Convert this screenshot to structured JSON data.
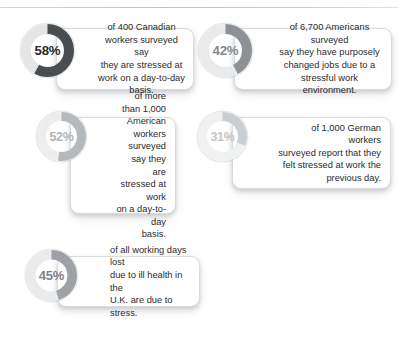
{
  "chart_data": {
    "type": "pie",
    "title": "",
    "subtitle": "",
    "legend": "none",
    "note": "Five separate donut (ring) gauges, each showing one percentage of a 100% ring. Arcs begin at 12 o'clock and sweep clockwise.",
    "categories": [
      "58%",
      "42%",
      "52%",
      "31%",
      "45%"
    ],
    "values": [
      58,
      42,
      52,
      31,
      45
    ],
    "ylim": [
      0,
      100
    ],
    "series": [
      {
        "name": "Canadian workers stressed day-to-day",
        "value": 58,
        "label": "58%",
        "caption": "of 400 Canadian workers surveyed say they are stressed at work on a day-to-day basis.",
        "sample_size": "400",
        "country": "Canada"
      },
      {
        "name": "Americans who changed jobs due to stress",
        "value": 42,
        "label": "42%",
        "caption": "of 6,700 Americans surveyed say they have purposely changed jobs due to a stressful work environment.",
        "sample_size": "6,700",
        "country": "United States"
      },
      {
        "name": "American workers stressed day-to-day",
        "value": 52,
        "label": "52%",
        "caption": "of more than 1,000 American workers surveyed say they are stressed at work on a day-to-day basis.",
        "sample_size": "more than 1,000",
        "country": "United States"
      },
      {
        "name": "German workers stressed previous day",
        "value": 31,
        "label": "31%",
        "caption": "of 1,000 German workers surveyed report that they felt stressed at work the previous day.",
        "sample_size": "1,000",
        "country": "Germany"
      },
      {
        "name": "UK working days lost to stress",
        "value": 45,
        "label": "45%",
        "caption": "of all working days lost due to ill health in the U.K. are due to stress.",
        "sample_size": "",
        "country": "United Kingdom"
      }
    ]
  },
  "stats": [
    {
      "id": "canadian-workers",
      "percent": "58%",
      "value": 58,
      "text": "of 400 Canadian\nworkers surveyed say\nthey are stressed at\nwork on a day-to-day basis.",
      "arc_color": "#4a4d50",
      "track_color": "#e3e5e7",
      "label_color": "#27292b"
    },
    {
      "id": "american-job-changers",
      "percent": "42%",
      "value": 42,
      "text": "of 6,700 Americans surveyed\nsay they have purposely\nchanged jobs due to a\nstressful work environment.",
      "arc_color": "#8d9094",
      "track_color": "#e8eaec",
      "label_color": "#86898d"
    },
    {
      "id": "american-workers",
      "percent": "52%",
      "value": 52,
      "text": "of more than 1,000\nAmerican workers\nsurveyed say they\nare stressed at work\non a day-to-day\nbasis.",
      "arc_color": "#b6b9bc",
      "track_color": "#ebedef",
      "label_color": "#b0b3b6"
    },
    {
      "id": "german-workers",
      "percent": "31%",
      "value": 31,
      "text": "of 1,000 German workers\nsurveyed report that they\nfelt stressed at work the\nprevious day.",
      "arc_color": "#cbced1",
      "track_color": "#eff1f2",
      "label_color": "#c2c5c8"
    },
    {
      "id": "uk-working-days",
      "percent": "45%",
      "value": 45,
      "text": "of all working days lost\ndue to ill health in the\nU.K. are due to stress.",
      "arc_color": "#9ea1a5",
      "track_color": "#e9ebed",
      "label_color": "#7f8286"
    }
  ],
  "layout": [
    {
      "card": {
        "x": 56,
        "y": 28,
        "w": 138,
        "h": 62
      },
      "donut": {
        "x": 21,
        "y": 24,
        "size": 53,
        "stroke": 10,
        "font": 13.2
      },
      "align": "align-center"
    },
    {
      "card": {
        "x": 234,
        "y": 28,
        "w": 158,
        "h": 62
      },
      "donut": {
        "x": 199,
        "y": 24,
        "size": 53,
        "stroke": 10,
        "font": 13.2
      },
      "align": "align-center"
    },
    {
      "card": {
        "x": 70,
        "y": 117,
        "w": 106,
        "h": 97
      },
      "donut": {
        "x": 37,
        "y": 112,
        "size": 49,
        "stroke": 9,
        "font": 12.4
      },
      "align": "align-right"
    },
    {
      "card": {
        "x": 232,
        "y": 117,
        "w": 159,
        "h": 72
      },
      "donut": {
        "x": 198,
        "y": 112,
        "size": 49,
        "stroke": 9,
        "font": 12.4
      },
      "align": "align-right"
    },
    {
      "card": {
        "x": 57,
        "y": 256,
        "w": 143,
        "h": 51
      },
      "donut": {
        "x": 26,
        "y": 250,
        "size": 51,
        "stroke": 9.5,
        "font": 13.0
      },
      "align": "align-left"
    }
  ]
}
